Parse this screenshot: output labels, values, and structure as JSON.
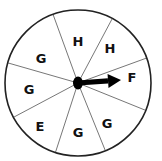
{
  "spinner": {
    "center": {
      "x": 78,
      "y": 83
    },
    "radius": 73,
    "outline_color": "#222222",
    "divider_color": "#777777",
    "divider_angles_deg": [
      -110,
      -62,
      -20,
      22,
      68,
      108,
      152,
      196
    ],
    "sections": [
      {
        "label": "H",
        "x": 78,
        "y": 42
      },
      {
        "label": "H",
        "x": 110,
        "y": 49
      },
      {
        "label": "F",
        "x": 132,
        "y": 78
      },
      {
        "label": "G",
        "x": 107,
        "y": 124
      },
      {
        "label": "G",
        "x": 78,
        "y": 133
      },
      {
        "label": "E",
        "x": 40,
        "y": 127
      },
      {
        "label": "G",
        "x": 29,
        "y": 90
      },
      {
        "label": "G",
        "x": 41,
        "y": 59
      }
    ],
    "pointer": {
      "hub_radius": 5,
      "tip": {
        "x": 121,
        "y": 80
      },
      "color": "#000000",
      "points_to": "F"
    }
  }
}
